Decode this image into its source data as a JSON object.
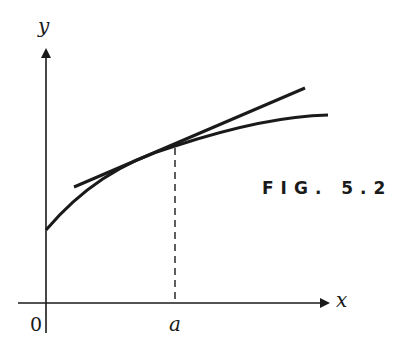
{
  "figure": {
    "caption": "FIG. 5.2",
    "axes": {
      "x_label": "x",
      "y_label": "y",
      "origin_label": "0",
      "tick_label": "a"
    },
    "elements": [
      {
        "name": "concave-curve",
        "description": "increasing concave-down curve y = f(x)"
      },
      {
        "name": "tangent-line",
        "description": "tangent line touching the curve at x = a"
      },
      {
        "name": "dashed-line",
        "description": "vertical dashed line from tangent point down to x-axis at a"
      }
    ],
    "colors": {
      "ink": "#1a1a1a",
      "background": "#ffffff"
    }
  }
}
